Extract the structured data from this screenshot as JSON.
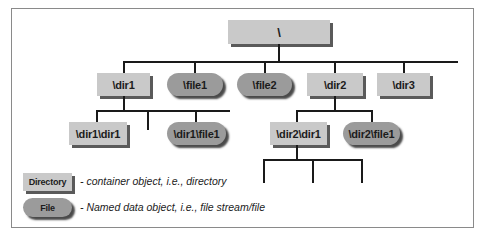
{
  "diagram": {
    "root": {
      "label": "\\",
      "type": "directory"
    },
    "level1": [
      {
        "label": "\\dir1",
        "type": "directory"
      },
      {
        "label": "\\file1",
        "type": "file"
      },
      {
        "label": "\\file2",
        "type": "file"
      },
      {
        "label": "\\dir2",
        "type": "directory"
      },
      {
        "label": "\\dir3",
        "type": "directory"
      }
    ],
    "dir1_children": [
      {
        "label": "\\dir1\\dir1",
        "type": "directory"
      },
      {
        "label": "\\dir1\\file1",
        "type": "file"
      }
    ],
    "dir2_children": [
      {
        "label": "\\dir2\\dir1",
        "type": "directory"
      },
      {
        "label": "\\dir2\\file1",
        "type": "file"
      }
    ],
    "edges": [
      [
        "\\",
        "\\dir1"
      ],
      [
        "\\",
        "\\file1"
      ],
      [
        "\\",
        "\\file2"
      ],
      [
        "\\",
        "\\dir2"
      ],
      [
        "\\",
        "\\dir3"
      ],
      [
        "\\dir1",
        "\\dir1\\dir1"
      ],
      [
        "\\dir1",
        "\\dir1\\file1"
      ],
      [
        "\\dir2",
        "\\dir2\\dir1"
      ],
      [
        "\\dir2",
        "\\dir2\\file1"
      ]
    ]
  },
  "legend": {
    "directory": {
      "label": "Directory",
      "description": "- container object, i.e., directory"
    },
    "file": {
      "label": "File",
      "description": "- Named data object, i.e., file stream/file"
    }
  },
  "colors": {
    "directory_fill": "#c9c9c9",
    "file_fill": "#9b9b9b",
    "shadow": "#5a5a5a",
    "line": "#1a1a1a",
    "frame": "#8a8a8a"
  }
}
